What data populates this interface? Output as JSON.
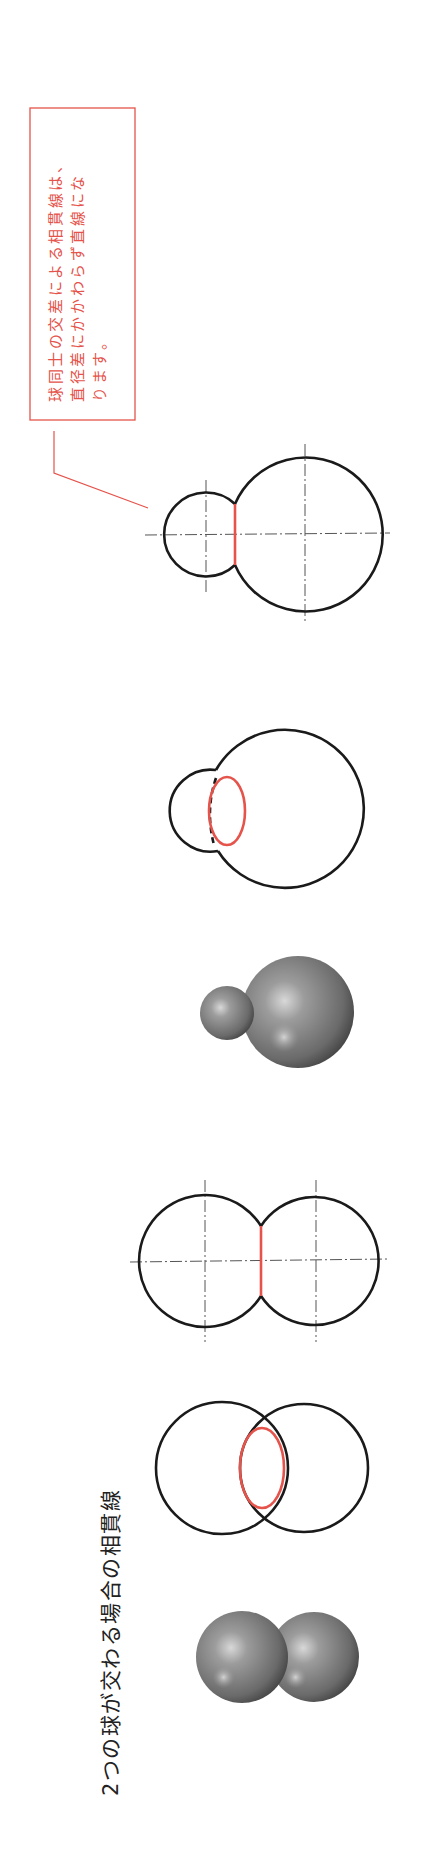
{
  "title": "2つの球が交わる場合の相貫線",
  "callout": {
    "lines": [
      "球同士の交差による相貫線は、",
      "直径差にかかわらず直線にな",
      "ります。"
    ],
    "color": "#e5534b"
  },
  "figures": {
    "equal_spheres": {
      "shaded_render": "two equal spheres intersecting",
      "oblique_view": "two equal circles with red elliptical intersection curve",
      "front_view": "two equal circles with red straight intersection line"
    },
    "unequal_spheres": {
      "shaded_render": "small and large sphere intersecting",
      "oblique_view": "small and large circles with red elliptical intersection curve",
      "front_view": "small and large circles with red straight intersection line"
    }
  },
  "colors": {
    "outline": "#1a1a1a",
    "intersection": "#e5534b",
    "centerline": "#555555"
  }
}
